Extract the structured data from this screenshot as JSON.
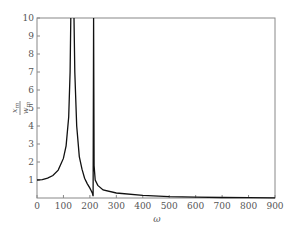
{
  "chart_data": {
    "type": "line",
    "title": "",
    "xlabel": "ω",
    "ylabel": "x_m / w_m",
    "xlim": [
      0,
      900
    ],
    "ylim": [
      0,
      10
    ],
    "xticks": [
      0,
      100,
      200,
      300,
      400,
      500,
      600,
      700,
      800,
      900
    ],
    "yticks": [
      1,
      2,
      3,
      4,
      5,
      6,
      7,
      8,
      9,
      10
    ],
    "grid": false,
    "legend": null,
    "series": [
      {
        "name": "response",
        "x": [
          0,
          20,
          40,
          60,
          80,
          100,
          110,
          120,
          125,
          128,
          140,
          143,
          150,
          160,
          170,
          180,
          190,
          200,
          205,
          210,
          212,
          214,
          216,
          220,
          230,
          250,
          300,
          400,
          500,
          600,
          700,
          800,
          900
        ],
        "y": [
          1.0,
          1.02,
          1.1,
          1.25,
          1.55,
          2.2,
          2.9,
          4.5,
          7.0,
          10.0,
          10.0,
          7.0,
          4.0,
          2.3,
          1.6,
          1.1,
          0.8,
          0.55,
          0.4,
          0.25,
          0.1,
          10.0,
          1.8,
          1.0,
          0.7,
          0.45,
          0.28,
          0.15,
          0.08,
          0.05,
          0.03,
          0.02,
          0.01
        ]
      }
    ]
  }
}
